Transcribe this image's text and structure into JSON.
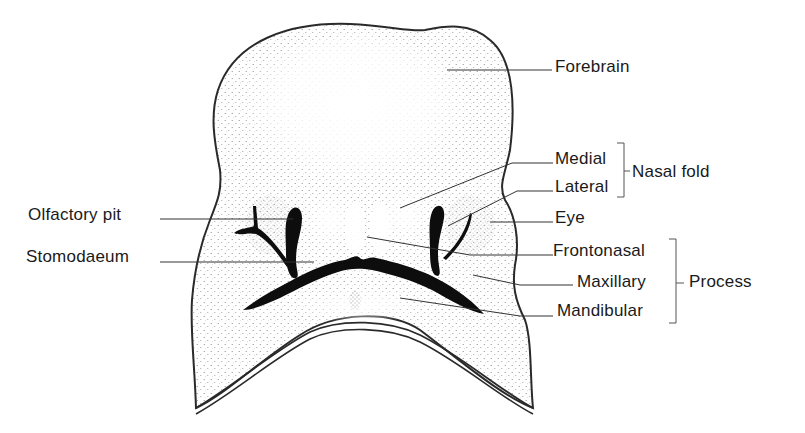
{
  "diagram": {
    "labels": {
      "forebrain": "Forebrain",
      "medial": "Medial",
      "lateral": "Lateral",
      "nasal_fold": "Nasal fold",
      "eye": "Eye",
      "olfactory_pit": "Olfactory pit",
      "stomodaeum": "Stomodaeum",
      "frontonasal": "Frontonasal",
      "maxillary": "Maxillary",
      "mandibular": "Mandibular",
      "process": "Process"
    },
    "groups": [
      {
        "name": "Nasal fold",
        "members": [
          "Medial",
          "Lateral"
        ]
      },
      {
        "name": "Process",
        "members": [
          "Frontonasal",
          "Maxillary",
          "Mandibular"
        ]
      }
    ],
    "colors": {
      "ink": "#1a1a1a",
      "stipple": "#8a8a8a",
      "background": "#ffffff"
    }
  }
}
